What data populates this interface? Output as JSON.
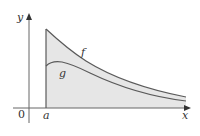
{
  "diagram": {
    "axes": {
      "x_label": "x",
      "y_label": "y",
      "origin_label": "0"
    },
    "markers": {
      "a_label": "a"
    },
    "curves": [
      {
        "name": "f",
        "label": "f"
      },
      {
        "name": "g",
        "label": "g"
      }
    ],
    "colors": {
      "curve": "#5a5a5a",
      "axis": "#666666",
      "fill_region": "#e6e6e6"
    }
  }
}
